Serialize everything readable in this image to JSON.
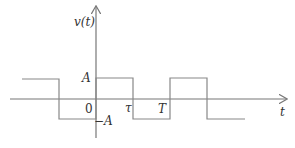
{
  "diagram": {
    "y_axis_label": "v(t)",
    "x_axis_label": "t",
    "labels": {
      "high": "A",
      "low": "−A",
      "origin": "0",
      "tau": "τ",
      "period": "T"
    },
    "colors": {
      "line": "#888888",
      "axis": "#777777",
      "text": "#333333"
    }
  }
}
